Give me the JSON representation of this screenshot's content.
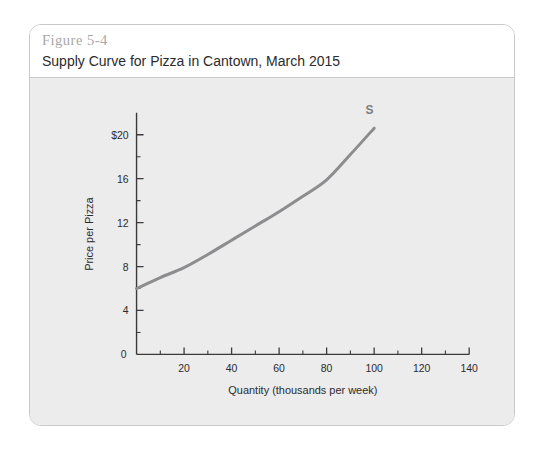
{
  "figure": {
    "number": "Figure 5-4",
    "title": "Supply Curve for Pizza in Cantown, March 2015"
  },
  "chart_data": {
    "type": "line",
    "title": "Supply Curve for Pizza in Cantown, March 2015",
    "xlabel": "Quantity (thousands per week)",
    "ylabel": "Price per Pizza",
    "xlim": [
      0,
      140
    ],
    "ylim": [
      0,
      22
    ],
    "grid": false,
    "legend": "none",
    "x_ticks": [
      0,
      20,
      40,
      60,
      80,
      100,
      120,
      140
    ],
    "x_tick_labels": [
      "0",
      "20",
      "40",
      "60",
      "80",
      "100",
      "120",
      "140"
    ],
    "x_minor_ticks": [
      10,
      30,
      50,
      70,
      90,
      110,
      130
    ],
    "y_ticks": [
      0,
      4,
      8,
      12,
      16,
      20
    ],
    "y_tick_labels": [
      "0",
      "4",
      "8",
      "12",
      "16",
      "$20"
    ],
    "y_minor_ticks": [
      2,
      6,
      10,
      14,
      18
    ],
    "series": [
      {
        "name": "S",
        "label": "S",
        "color": "#8d8d8f",
        "x": [
          0,
          10,
          20,
          30,
          40,
          50,
          60,
          70,
          80,
          90,
          100
        ],
        "y": [
          6.0,
          7.0,
          7.9,
          9.1,
          10.4,
          11.7,
          13.0,
          14.4,
          15.9,
          18.2,
          20.6
        ]
      }
    ],
    "annotations": [
      {
        "text": "S",
        "x": 98,
        "y": 21.9
      }
    ]
  }
}
